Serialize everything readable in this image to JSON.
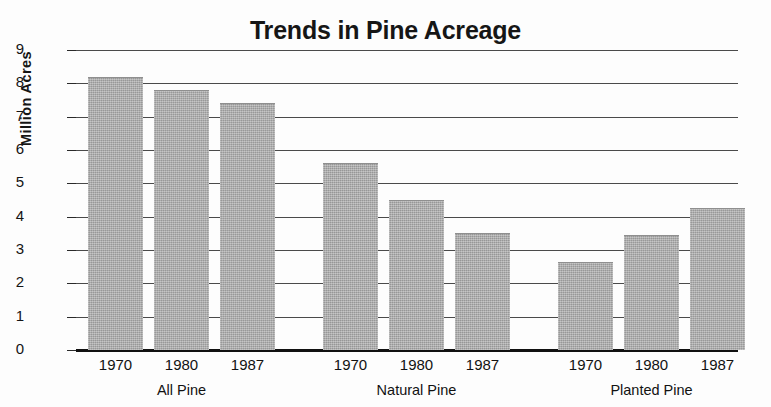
{
  "chart_data": {
    "type": "bar",
    "title": "Trends in Pine Acreage",
    "xlabel": "",
    "ylabel": "Million Acres",
    "ylim": [
      0,
      9
    ],
    "ytick_step": 1,
    "yticks": [
      "9",
      "8",
      "7",
      "6",
      "5",
      "4",
      "3",
      "2",
      "1",
      "0"
    ],
    "grid": true,
    "legend": false,
    "categories": [
      "1970",
      "1980",
      "1987",
      "1970",
      "1980",
      "1987",
      "1970",
      "1980",
      "1987"
    ],
    "values": [
      8.2,
      7.8,
      7.4,
      5.6,
      4.5,
      3.5,
      2.65,
      3.45,
      4.25
    ],
    "groups": [
      {
        "name": "All Pine",
        "categories": [
          "1970",
          "1980",
          "1987"
        ],
        "values": [
          8.2,
          7.8,
          7.4
        ]
      },
      {
        "name": "Natural Pine",
        "categories": [
          "1970",
          "1980",
          "1987"
        ],
        "values": [
          5.6,
          4.5,
          3.5
        ]
      },
      {
        "name": "Planted Pine",
        "categories": [
          "1970",
          "1980",
          "1987"
        ],
        "values": [
          2.65,
          3.45,
          4.25
        ]
      }
    ],
    "bar_color": "#a9a9a9",
    "axis_color": "#111111",
    "background": "#fdfdfd"
  },
  "bars": [
    {
      "label": "1970",
      "group": "All Pine",
      "value": 8.2
    },
    {
      "label": "1980",
      "group": "All Pine",
      "value": 7.8
    },
    {
      "label": "1987",
      "group": "All Pine",
      "value": 7.4
    },
    {
      "label": "1970",
      "group": "Natural Pine",
      "value": 5.6
    },
    {
      "label": "1980",
      "group": "Natural Pine",
      "value": 4.5
    },
    {
      "label": "1987",
      "group": "Natural Pine",
      "value": 3.5
    },
    {
      "label": "1970",
      "group": "Planted Pine",
      "value": 2.65
    },
    {
      "label": "1980",
      "group": "Planted Pine",
      "value": 3.45
    },
    {
      "label": "1987",
      "group": "Planted Pine",
      "value": 4.25
    }
  ],
  "group_labels": [
    "All Pine",
    "Natural Pine",
    "Planted Pine"
  ]
}
